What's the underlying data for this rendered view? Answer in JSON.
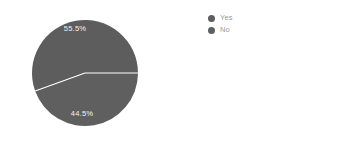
{
  "background_color": "#ffffff",
  "chart_data": {
    "type": "pie",
    "title": "",
    "categories": [
      "Yes",
      "No"
    ],
    "values": [
      55.5,
      44.5
    ],
    "value_unit": "%",
    "data_labels": [
      "55.5%",
      "44.5%"
    ],
    "colors": [
      "#5d5d5d",
      "#5f5f5f"
    ],
    "slice_separator_color": "#ffffff",
    "start_angle_deg": 0,
    "direction": "counterclockwise",
    "label_text_color": "#ffffff",
    "legend": {
      "position": "right",
      "entries": [
        {
          "label": "Yes",
          "color": "#5d5d5d"
        },
        {
          "label": "No",
          "color": "#5f5f5f"
        }
      ]
    },
    "geometry": {
      "center_x": 85,
      "center_y": 73,
      "radius": 53
    }
  }
}
